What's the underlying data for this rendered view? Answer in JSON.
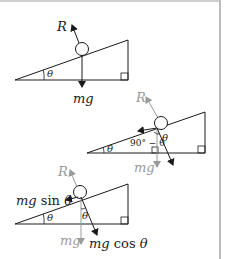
{
  "colors": {
    "ink": "#1a1a1a",
    "grey": "#9a9a9a",
    "border": "#bdbdbd"
  },
  "diagram1": {
    "reaction_label": "R",
    "weight_label": "mg",
    "angle_label": "θ"
  },
  "diagram2": {
    "reaction_label": "R",
    "weight_label": "mg",
    "angle_base_label": "θ",
    "angle_complement_label": "90° − θ",
    "angle_at_ball_label": "θ"
  },
  "diagram3": {
    "reaction_label": "R",
    "weight_label": "mg",
    "angle_base_label": "θ",
    "angle_at_ball_label": "θ",
    "parallel_component": {
      "prefix": "mg",
      "func": " sin ",
      "angle": "θ"
    },
    "perpendicular_component": {
      "prefix": "mg",
      "func": " cos ",
      "angle": "θ"
    }
  }
}
